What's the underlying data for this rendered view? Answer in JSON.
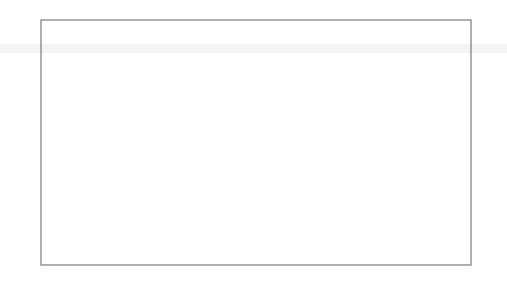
{
  "chart_data": {
    "type": "line",
    "title": "",
    "caption": "10-year fixed interest rates on swaps, monthly averages",
    "ylabel": "%",
    "xlabel": "",
    "ylim": [
      3,
      15
    ],
    "ytick_values": [
      3,
      5,
      7,
      9,
      11,
      13,
      15
    ],
    "ytick_labels": [
      "3",
      "5",
      "7",
      "9",
      "11",
      "13",
      "15"
    ],
    "ytick_labels_right": [
      "3",
      "5",
      "7",
      "9",
      "11",
      "13",
      "15"
    ],
    "xlim": [
      1992.0,
      2002.92
    ],
    "xtick_values": [
      1992,
      1993,
      1994,
      1995,
      1996,
      1997,
      1998,
      1999,
      2000,
      2001,
      2002
    ],
    "xtick_labels": [
      "92",
      "93",
      "94",
      "95",
      "96",
      "97",
      "98",
      "99",
      "00",
      "01",
      "02"
    ],
    "grid": false,
    "legend_position": "top-right-inside",
    "x_step": 0.0833333,
    "series": [
      {
        "name": "Germany",
        "color": "#000000",
        "width": 2.1,
        "dash": "none",
        "x_start": 1992.0,
        "values": [
          11.1,
          10.95,
          11.0,
          11.0,
          11.0,
          11.0,
          11.0,
          11.2,
          11.8,
          12.4,
          12.95,
          13.15,
          12.9,
          12.5,
          12.35,
          12.45,
          12.3,
          11.9,
          11.5,
          11.4,
          11.25,
          11.0,
          10.4,
          9.6,
          8.85,
          8.2,
          7.7,
          7.5,
          7.35,
          7.3,
          7.35,
          7.7,
          8.3,
          8.9,
          9.3,
          9.9,
          10.3,
          10.8,
          11.2,
          11.55,
          11.9,
          12.2,
          12.45,
          12.7,
          12.65,
          12.4,
          12.0,
          11.7,
          11.45,
          11.6,
          11.3,
          11.0,
          10.75,
          10.5,
          10.3,
          10.0,
          9.5,
          9.6,
          9.35,
          9.1,
          8.95,
          8.6,
          8.3,
          8.0,
          7.75,
          7.5,
          7.25,
          7.0,
          6.9,
          6.8,
          6.6,
          6.4,
          6.2,
          6.0,
          5.9,
          5.8,
          5.7,
          5.55,
          5.4,
          5.3,
          5.2,
          5.1,
          5.0,
          4.8,
          4.7,
          4.65,
          4.55,
          4.75,
          5.15,
          5.5,
          5.45,
          5.75,
          6.1,
          6.05,
          6.0,
          6.1,
          6.1,
          6.15,
          6.1,
          6.2,
          6.2,
          6.15,
          6.15,
          6.1,
          6.0,
          5.85,
          5.75,
          5.7,
          5.65,
          5.75,
          5.75,
          5.6,
          5.5,
          5.35,
          5.25,
          5.45,
          5.6,
          5.65,
          5.55,
          5.6,
          5.75,
          5.75,
          5.6,
          5.4,
          5.15,
          5.0,
          4.85,
          4.9,
          4.75
        ]
      },
      {
        "name": "France",
        "color": "#5b5b5b",
        "width": 1.3,
        "dash": "none",
        "x_start": 1992.0,
        "values": [
          8.55,
          8.5,
          8.6,
          8.7,
          8.7,
          8.7,
          8.75,
          8.85,
          9.1,
          9.3,
          9.15,
          8.95,
          8.8,
          8.6,
          8.55,
          8.7,
          8.6,
          8.4,
          8.2,
          8.15,
          7.9,
          7.6,
          7.2,
          6.9,
          6.7,
          6.55,
          6.4,
          6.35,
          6.5,
          6.55,
          6.65,
          6.9,
          7.35,
          7.6,
          7.75,
          8.05,
          8.3,
          8.5,
          8.65,
          8.6,
          8.4,
          8.2,
          8.05,
          7.95,
          7.85,
          7.8,
          7.7,
          7.6,
          7.55,
          7.6,
          7.4,
          7.25,
          7.1,
          7.0,
          6.95,
          6.8,
          6.6,
          6.7,
          6.55,
          6.35,
          6.25,
          6.1,
          5.95,
          5.85,
          5.8,
          5.7,
          5.6,
          5.5,
          5.45,
          5.4,
          5.3,
          5.2,
          5.1,
          5.0,
          4.95,
          4.9,
          4.85,
          4.75,
          4.7,
          4.65,
          4.6,
          4.55,
          4.5,
          4.4,
          4.35,
          4.3,
          4.25,
          4.45,
          4.85,
          5.2,
          5.2,
          5.5,
          5.9
        ]
      },
      {
        "name": "Italy",
        "color": "#cfcfcf",
        "width": 1.5,
        "dash": "none",
        "x_start": 1992.0,
        "values": [
          11.7,
          11.75,
          11.85,
          11.9,
          11.9,
          12.0,
          12.1,
          12.4,
          13.0,
          13.2,
          13.3,
          13.4,
          13.1,
          12.7,
          12.5,
          12.6,
          12.4,
          12.05,
          11.7,
          11.5,
          11.3,
          11.0,
          10.5,
          9.7,
          9.0,
          8.4,
          7.95,
          7.8,
          7.7,
          7.65,
          7.7,
          8.1,
          8.7,
          9.2,
          9.6,
          10.2,
          10.6,
          11.1,
          11.5,
          11.8,
          12.1,
          12.35,
          12.5,
          12.5,
          12.4,
          12.2,
          11.9,
          11.75,
          11.6,
          11.75,
          11.5,
          11.25,
          11.1,
          10.9,
          10.8,
          10.55,
          10.2,
          10.3,
          10.0,
          9.7,
          9.5,
          9.2,
          8.95,
          8.7,
          8.5,
          8.3,
          8.1,
          7.85,
          7.7,
          7.55,
          7.35,
          7.1,
          6.85,
          6.6,
          6.45,
          6.3,
          6.15,
          5.95,
          5.75,
          5.6,
          5.5,
          5.4,
          5.3,
          5.1,
          4.95,
          4.9,
          4.8,
          5.0,
          5.4,
          5.75
        ]
      },
      {
        "name": "Spain",
        "color": "#3a3a3a",
        "width": 1.5,
        "dash": "none",
        "x_start": 1992.0,
        "values": [
          8.2,
          8.15,
          8.3,
          8.5,
          8.5,
          8.45,
          8.5,
          8.6,
          9.0,
          9.35,
          9.2,
          8.95,
          8.7,
          8.4,
          8.25,
          8.4,
          8.25,
          8.0,
          7.8,
          7.7,
          7.5,
          7.2,
          6.85,
          6.55,
          6.35,
          6.2,
          6.05,
          6.0,
          6.15,
          6.2,
          6.35,
          6.6,
          7.05,
          7.3,
          7.5,
          7.8,
          8.05,
          8.25,
          8.4,
          8.3,
          8.1,
          7.9,
          7.75,
          7.6,
          7.5,
          7.45,
          7.35,
          7.25,
          7.2,
          7.3,
          7.1,
          6.95,
          6.8,
          6.7,
          6.65,
          6.5,
          6.3,
          6.45,
          6.3,
          6.1,
          6.0,
          5.85,
          5.7,
          5.6,
          5.55,
          5.45,
          5.35,
          5.25,
          5.2,
          5.15,
          5.05,
          4.95,
          4.85,
          4.75,
          4.7,
          4.65,
          4.6,
          4.5,
          4.45,
          4.4,
          4.35,
          4.3,
          4.25,
          4.15,
          4.1,
          4.05,
          4.0,
          4.2,
          4.6,
          4.95
        ]
      },
      {
        "name": "Netherlands",
        "color": "#7d7d7d",
        "width": 1.2,
        "dash": "none",
        "x_start": 1992.0,
        "values": [
          8.45,
          8.4,
          8.5,
          8.6,
          8.6,
          8.6,
          8.65,
          8.75,
          9.0,
          9.2,
          9.05,
          8.85,
          8.7,
          8.5,
          8.45,
          8.6,
          8.5,
          8.3,
          8.1,
          8.05,
          7.8,
          7.5,
          7.1,
          6.8,
          6.6,
          6.45,
          6.3,
          6.25,
          6.4,
          6.45,
          6.55,
          6.8,
          7.25,
          7.5,
          7.65,
          7.95,
          8.2,
          8.4,
          8.55,
          8.5,
          8.3,
          8.1,
          7.95,
          7.85,
          7.75,
          7.7,
          7.6,
          7.5,
          7.45,
          7.5,
          7.3,
          7.15,
          7.0,
          6.9,
          6.85,
          6.7,
          6.5,
          6.6,
          6.45,
          6.25,
          6.15,
          6.0,
          5.85,
          5.75,
          5.7,
          5.6,
          5.5,
          5.4,
          5.35,
          5.3,
          5.2,
          5.1,
          5.0,
          4.9,
          4.85,
          4.8,
          4.75,
          4.65,
          4.6,
          4.55,
          4.5,
          4.45,
          4.4,
          4.3,
          4.25,
          4.2,
          4.15,
          4.35,
          4.75,
          5.1
        ]
      },
      {
        "name": "Belgium",
        "color": "#d8d8d8",
        "width": 1.5,
        "dash": "none",
        "x_start": 1992.0,
        "values": [
          8.7,
          8.65,
          8.75,
          8.85,
          8.85,
          8.85,
          8.9,
          9.0,
          9.3,
          9.5,
          9.3,
          9.1,
          8.95,
          8.75,
          8.7,
          8.85,
          8.75,
          8.55,
          8.35,
          8.3,
          8.1,
          7.8,
          7.5,
          7.3,
          7.2,
          7.1,
          7.0,
          7.0,
          7.15,
          7.2,
          7.3,
          7.5,
          7.9,
          8.1,
          8.25,
          8.5,
          8.7,
          8.85,
          8.95,
          8.85,
          8.65,
          8.5,
          8.4,
          8.35,
          8.3,
          8.2,
          8.1,
          8.0,
          7.95,
          8.0,
          7.85,
          7.7,
          7.55,
          7.45,
          7.4,
          7.25,
          7.05,
          7.15,
          7.0,
          6.85,
          6.75,
          6.6,
          6.45,
          6.3,
          6.2,
          6.1,
          6.0,
          5.9,
          5.85,
          5.8,
          5.7,
          5.6,
          5.5,
          5.4,
          5.35,
          5.3,
          5.25,
          5.15,
          5.1,
          5.05,
          5.0,
          4.95,
          4.9,
          4.8,
          4.75,
          4.7,
          4.65,
          4.85,
          5.25,
          5.6
        ]
      },
      {
        "name": "Finland",
        "color": "#bfbfbf",
        "width": 1.5,
        "dash": "none",
        "x_start": 1992.0,
        "values": [
          8.35,
          8.3,
          8.4,
          8.55,
          8.55,
          8.5,
          8.55,
          8.7,
          9.05,
          9.25,
          9.1,
          8.9,
          8.75,
          8.55,
          8.4,
          8.5,
          8.35,
          8.15,
          7.95,
          7.85,
          7.65,
          7.35,
          7.0,
          6.7,
          6.5,
          6.4,
          6.25,
          6.2,
          6.3,
          6.4,
          6.5,
          6.75,
          7.2,
          7.45,
          7.6,
          7.9,
          8.15,
          8.35,
          8.5,
          8.45,
          8.25,
          8.05,
          7.9,
          7.8,
          7.7,
          7.65,
          7.55,
          7.45,
          7.4,
          7.45,
          7.25,
          7.1,
          6.95,
          6.85,
          6.8,
          6.65,
          6.45,
          6.55,
          6.4,
          6.2,
          6.1,
          5.95,
          5.8,
          5.7,
          5.65,
          5.55,
          5.45,
          5.35,
          5.3,
          5.25,
          5.15,
          5.05,
          4.95,
          4.85,
          4.8,
          4.75,
          4.7,
          4.6,
          4.55,
          4.5,
          4.45,
          4.4,
          4.35,
          4.25,
          4.2,
          4.15,
          4.1,
          4.3,
          4.7,
          5.05
        ]
      },
      {
        "name": "Austria",
        "color": "#6a6a6a",
        "width": 1.3,
        "dash": "none",
        "x_start": 1992.0,
        "values": [
          8.6,
          8.55,
          8.65,
          8.75,
          8.75,
          8.75,
          8.8,
          8.9,
          9.2,
          9.4,
          9.25,
          9.05,
          8.9,
          8.7,
          8.6,
          8.75,
          8.65,
          8.45,
          8.25,
          8.2,
          8.0,
          7.7,
          7.35,
          7.1,
          6.9,
          6.75,
          6.6,
          6.55,
          6.7,
          6.75,
          6.85,
          7.1,
          7.5,
          7.7,
          7.85,
          8.1,
          8.4,
          8.6,
          8.7,
          8.6,
          8.4,
          8.2,
          8.1,
          8.0,
          7.9,
          7.85,
          7.75,
          7.65,
          7.6,
          7.65,
          7.45,
          7.3,
          7.15,
          7.05,
          7.0,
          6.85,
          6.65,
          6.75,
          6.6,
          6.4,
          6.3,
          6.15,
          6.0,
          5.9,
          5.85,
          5.75,
          5.65,
          5.55,
          5.5,
          5.45,
          5.35,
          5.25,
          5.15,
          5.05,
          5.0,
          4.95,
          4.9,
          4.8,
          4.75,
          4.7,
          4.65,
          4.6,
          4.55,
          4.45,
          4.4,
          4.35,
          4.3,
          4.5,
          4.9,
          5.25
        ]
      },
      {
        "name": "Portugal",
        "color": "#111111",
        "width": 2.0,
        "dash": "5,3",
        "x_start": 1995.25,
        "values": [
          11.9,
          12.15,
          12.1,
          12.35,
          12.6,
          12.45,
          12.4,
          12.55,
          12.7,
          12.45,
          12.2,
          12.1,
          11.9,
          11.75,
          11.5,
          11.3,
          11.1,
          10.95,
          10.8,
          10.6,
          10.4,
          10.2,
          10.0,
          9.8,
          9.6,
          9.4,
          9.2,
          8.9,
          8.6,
          8.3,
          8.0,
          7.7,
          7.4,
          7.1,
          6.85,
          6.6,
          6.4,
          6.2,
          6.0,
          5.85
        ]
      },
      {
        "name": "Ireland",
        "color": "#111111",
        "width": 1.6,
        "dash": "2,3",
        "x_start": 1997.75,
        "values": [
          6.9,
          6.8,
          6.7,
          6.6,
          6.5,
          6.4,
          6.3,
          6.2,
          6.1,
          6.0,
          5.9,
          5.8
        ]
      },
      {
        "name": "Greece",
        "color": "#5a5a5a",
        "width": 1.3,
        "dash": "1,2.2",
        "x_start": 1997.75,
        "values": [
          10.3,
          9.9,
          9.6,
          9.95,
          9.5,
          9.2,
          9.55,
          10.1,
          10.5,
          10.15,
          9.7,
          9.35,
          9.0,
          8.6,
          8.2,
          7.9,
          7.6,
          7.35,
          7.1,
          6.95,
          6.7,
          6.45,
          6.8,
          6.55,
          6.2,
          6.0,
          5.8,
          5.65,
          5.5,
          5.45,
          5.55,
          5.5,
          5.45,
          5.5,
          5.6,
          5.75,
          5.9,
          6.1,
          6.35,
          6.55,
          6.75,
          6.9,
          6.75,
          6.6,
          6.5,
          6.55,
          6.45,
          6.3,
          6.35,
          6.25,
          6.15,
          6.2,
          6.1,
          6.05,
          6.1,
          6.15,
          6.05,
          5.95,
          5.9,
          5.95
        ]
      }
    ]
  },
  "legend": {
    "columns": [
      [
        {
          "label": "Germany",
          "series": "Germany"
        },
        {
          "label": "Italy",
          "series": "Italy"
        },
        {
          "label": "Netherlands",
          "series": "Netherlands"
        },
        {
          "label": "Finland",
          "series": "Finland"
        },
        {
          "label": "Portugal",
          "series": "Portugal"
        },
        {
          "label": "Greece",
          "series": "Greece"
        }
      ],
      [
        {
          "label": "France",
          "series": "France"
        },
        {
          "label": "Spain",
          "series": "Spain"
        },
        {
          "label": "Belgium",
          "series": "Belgium"
        },
        {
          "label": "Austria",
          "series": "Austria"
        },
        {
          "label": "Ireland",
          "series": "Ireland"
        }
      ]
    ]
  },
  "colors": {
    "frame": "#6e6e6e",
    "text": "#1a1a1a",
    "background": "#ffffff",
    "band": "#f2f2f2"
  }
}
